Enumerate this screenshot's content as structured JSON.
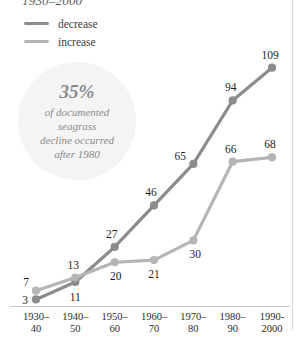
{
  "chart_data": {
    "type": "line",
    "title": "1930–2000",
    "xlabel": "",
    "ylabel": "",
    "grid": false,
    "legend_position": "top-left",
    "ylim": [
      0,
      118
    ],
    "categories": [
      "1930–40",
      "1940–50",
      "1950–60",
      "1960–70",
      "1970–80",
      "1980–90",
      "1990-2000"
    ],
    "category_lines": [
      [
        "1930–",
        "40"
      ],
      [
        "1940–",
        "50"
      ],
      [
        "1950–",
        "60"
      ],
      [
        "1960–",
        "70"
      ],
      [
        "1970–",
        "80"
      ],
      [
        "1980–",
        "90"
      ],
      [
        "1990-",
        "2000"
      ]
    ],
    "series": [
      {
        "name": "decrease",
        "color": "#8c8c8c",
        "values": [
          3,
          11,
          27,
          46,
          65,
          94,
          109
        ],
        "label_offsets": [
          {
            "dx": -11,
            "dy": 1
          },
          {
            "dx": 0,
            "dy": 15
          },
          {
            "dx": -3,
            "dy": -13
          },
          {
            "dx": -3,
            "dy": -13
          },
          {
            "dx": -13,
            "dy": -8
          },
          {
            "dx": -2,
            "dy": -13
          },
          {
            "dx": -2,
            "dy": -13
          }
        ]
      },
      {
        "name": "increase",
        "color": "#b5b5b5",
        "values": [
          7,
          13,
          20,
          21,
          30,
          66,
          68
        ],
        "label_offsets": [
          {
            "dx": -10,
            "dy": -9
          },
          {
            "dx": -2,
            "dy": -13
          },
          {
            "dx": 1,
            "dy": 14
          },
          {
            "dx": 0,
            "dy": 14
          },
          {
            "dx": 2,
            "dy": 14
          },
          {
            "dx": -2,
            "dy": -13
          },
          {
            "dx": -2,
            "dy": -13
          }
        ]
      }
    ],
    "annotation": {
      "stat": "35%",
      "lines": [
        "of documented",
        "seagrass",
        "decline occurred",
        "after 1980"
      ]
    }
  }
}
